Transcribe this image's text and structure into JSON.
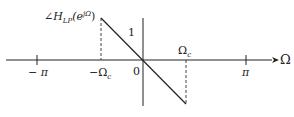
{
  "diagram": {
    "title_label": {
      "angle": "∠",
      "H": "H",
      "sub": "LP",
      "arg_open": "(e",
      "sup": "jΩ",
      "arg_close": ")"
    },
    "y_marker": "1",
    "x_axis_label": "Ω",
    "ticks": {
      "neg_pi": "− π",
      "neg_omega_c": {
        "prefix": "−Ω",
        "sub": "c"
      },
      "origin": "0",
      "omega_c": {
        "main": "Ω",
        "sub": "c"
      },
      "pi": "π"
    },
    "colors": {
      "line": "#222222",
      "dash": "#444444",
      "background": "#ffffff"
    }
  }
}
